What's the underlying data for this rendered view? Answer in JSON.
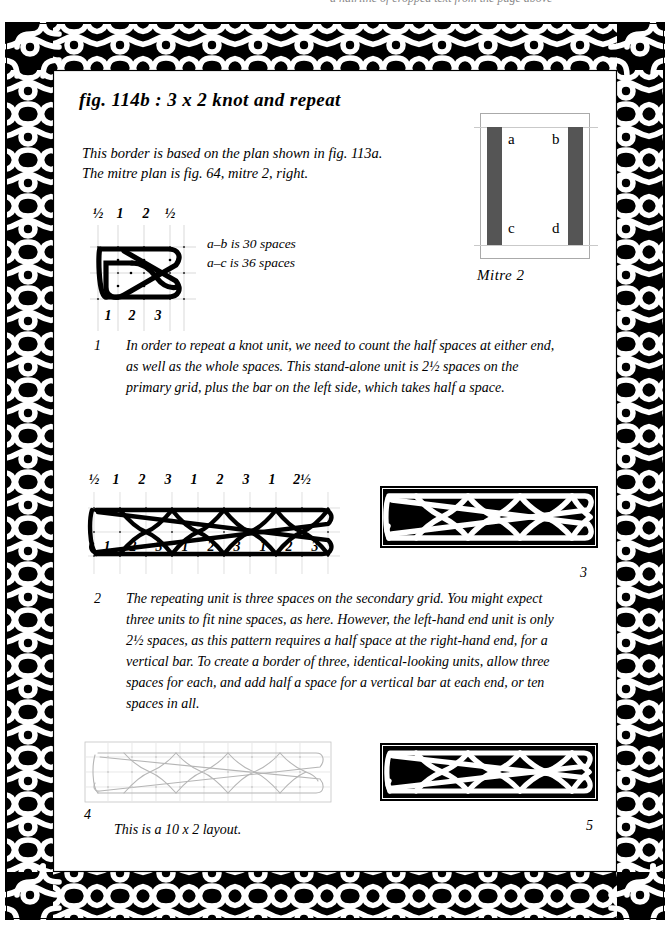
{
  "page": {
    "bleed_text": "a hairline of cropped text from the page above",
    "title": "fig. 114b : 3 x 2 knot and repeat",
    "intro_lines": [
      "This border is based on the plan shown in fig. 113a.",
      "The mitre plan is fig. 64, mitre 2, right."
    ],
    "spaces_notes": [
      "a–b is 30 spaces",
      "a–c is 36 spaces"
    ],
    "bottom_caption": "This is a 10 x 2 layout."
  },
  "mitre": {
    "caption": "Mitre 2",
    "labels": {
      "a": "a",
      "b": "b",
      "c": "c",
      "d": "d"
    },
    "bar_color": "#555555",
    "box_border_color": "#aaaaaa"
  },
  "paragraphs": [
    {
      "number": "1",
      "text": "In order to repeat a knot unit, we need to count the half spaces at either end, as well as the whole spaces. This stand-alone unit is 2½ spaces on the primary grid, plus the bar on the left side, which takes half a space."
    },
    {
      "number": "2",
      "text": "The repeating unit is three spaces on the secondary grid. You might expect three units to fit nine spaces, as here. However, the left-hand end unit is only 2½ spaces, as this pattern requires a half space at the right-hand end, for a vertical bar. To create a border of three, identical-looking units, allow three spaces for each, and add half a space for a vertical bar at each end, or ten spaces in all."
    }
  ],
  "figures": {
    "fig1": {
      "name": "stand-alone-3x2-knot-unit",
      "top_labels": [
        "½",
        "1",
        "2",
        "½"
      ],
      "bottom_labels": [
        "1",
        "2",
        "3"
      ],
      "style": "black-knot-on-grid"
    },
    "fig2": {
      "name": "repeated-knot-strip-nine-spaces",
      "top_labels": [
        "½",
        "1",
        "2",
        "3",
        "1",
        "2",
        "3",
        "1",
        "2½"
      ],
      "bottom_labels": [
        "1",
        "2",
        "3",
        "1",
        "2",
        "3",
        "1",
        "2",
        "3"
      ],
      "style": "black-knot-on-grid"
    },
    "fig3": {
      "name": "finished-border-nine-spaces",
      "number": "3",
      "style": "solid-black-border"
    },
    "fig4": {
      "name": "ten-by-two-layout-line-plan",
      "number": "4",
      "style": "light-grey-line-plan"
    },
    "fig5": {
      "name": "finished-border-ten-spaces",
      "number": "5",
      "style": "solid-black-border"
    }
  },
  "colors": {
    "ink": "#000000",
    "grid_line": "#cccccc",
    "light_plan": "#b8b8b8",
    "mitre_bar": "#555555"
  }
}
